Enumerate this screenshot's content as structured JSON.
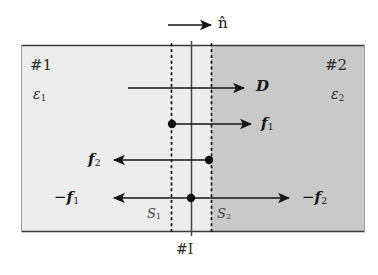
{
  "figure": {
    "colors": {
      "background": "#ffffff",
      "region1_fill": "#ededed",
      "region2_fill": "#c9c9c9",
      "line": "#1a1a1a",
      "text": "#1a1a1a"
    },
    "geometry": {
      "box_left": 21,
      "box_right": 365,
      "box_top": 45,
      "box_bottom": 232,
      "surface_s1_x": 171,
      "interface_x": 191,
      "surface_s2_x": 211,
      "center_line_top": 41,
      "center_line_bottom": 236
    }
  },
  "labels": {
    "normal_vector": "n̂",
    "region1": "#1",
    "region2": "#2",
    "permittivity1": "ε",
    "permittivity1_sub": "1",
    "permittivity2": "ε",
    "permittivity2_sub": "2",
    "displacement": "D",
    "force1": "f",
    "force1_sub": "1",
    "force2": "f",
    "force2_sub": "2",
    "neg_force1_sign": "−",
    "neg_force1": "f",
    "neg_force1_sub": "1",
    "neg_force2_sign": "−",
    "neg_force2": "f",
    "neg_force2_sub": "2",
    "surface1": "S",
    "surface1_sub": "1",
    "surface2": "S",
    "surface2_sub": "2",
    "interface": "#I"
  },
  "arrows": [
    {
      "name": "normal-vector-arrow",
      "x1": 168,
      "y": 25,
      "x2": 213,
      "direction": "right",
      "label": "n̂"
    },
    {
      "name": "displacement-arrow",
      "x1": 128,
      "y": 88,
      "x2": 246,
      "direction": "right",
      "label": "D",
      "dot": false
    },
    {
      "name": "force1-arrow",
      "x1": 172,
      "y": 124,
      "x2": 253,
      "direction": "right",
      "label": "f1",
      "dot": true,
      "dot_x": 172
    },
    {
      "name": "force2-arrow",
      "x1": 209,
      "y": 160,
      "x2": 112,
      "direction": "left",
      "label": "f2",
      "dot": true,
      "dot_x": 209
    },
    {
      "name": "neg-force1-arrow",
      "x1": 191,
      "y": 198,
      "x2": 112,
      "direction": "left",
      "label": "-f1",
      "dot": true,
      "dot_x": 191
    },
    {
      "name": "neg-force2-arrow",
      "x1": 191,
      "y": 198,
      "x2": 291,
      "direction": "right",
      "label": "-f2",
      "dot": true,
      "dot_x": 191
    }
  ]
}
